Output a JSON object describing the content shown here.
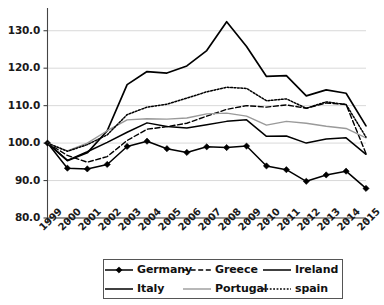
{
  "chart_data": {
    "type": "line",
    "title": "",
    "xlabel": "",
    "ylabel": "",
    "x": [
      "1999",
      "2000",
      "2001",
      "2002",
      "2003",
      "2004",
      "2005",
      "2006",
      "2007",
      "2008",
      "2009",
      "2010",
      "2011",
      "2012",
      "2013",
      "2014",
      "2015"
    ],
    "ylim": [
      80.0,
      135.0
    ],
    "yticks": [
      80.0,
      90.0,
      100.0,
      110.0,
      120.0,
      130.0
    ],
    "ytick_labels": [
      "80.0",
      "90.0",
      "100.0",
      "110.0",
      "120.0",
      "130.0"
    ],
    "grid": true,
    "legend_position": "bottom",
    "series": [
      {
        "name": "Germany",
        "style": "solid-marker",
        "marker": "diamond",
        "color": "#000000",
        "values": [
          100.0,
          93.3,
          93.1,
          94.3,
          99.1,
          100.5,
          98.5,
          97.5,
          99.0,
          98.8,
          99.2,
          93.9,
          92.9,
          89.8,
          91.5,
          92.5,
          87.9
        ]
      },
      {
        "name": "Greece",
        "style": "dashed",
        "marker": "none",
        "color": "#000000",
        "values": [
          100.0,
          96.7,
          94.9,
          96.4,
          100.7,
          103.7,
          104.4,
          105.3,
          107.2,
          109.0,
          110.0,
          109.6,
          110.2,
          109.3,
          110.7,
          110.3,
          97.2
        ]
      },
      {
        "name": "Ireland",
        "style": "solid-thick",
        "marker": "none",
        "color": "#000000",
        "values": [
          100.0,
          95.3,
          97.4,
          103.3,
          115.6,
          119.1,
          118.7,
          120.6,
          124.7,
          132.4,
          125.8,
          117.8,
          118.0,
          112.6,
          114.2,
          113.3,
          104.6
        ]
      },
      {
        "name": "Italy",
        "style": "solid",
        "marker": "none",
        "color": "#000000",
        "values": [
          100.0,
          95.4,
          97.7,
          100.2,
          102.9,
          105.4,
          104.4,
          104.0,
          104.9,
          105.8,
          106.2,
          101.8,
          101.9,
          100.0,
          101.1,
          101.4,
          97.0
        ]
      },
      {
        "name": "Portugal",
        "style": "solid-gray",
        "marker": "none",
        "color": "#9a9a9a",
        "values": [
          100.0,
          97.9,
          100.0,
          103.3,
          106.2,
          106.5,
          106.4,
          106.7,
          107.8,
          108.0,
          107.2,
          104.8,
          105.8,
          105.3,
          104.5,
          103.9,
          101.4
        ]
      },
      {
        "name": "spain",
        "style": "dotted",
        "marker": "none",
        "color": "#000000",
        "values": [
          100.0,
          97.8,
          99.6,
          102.2,
          107.6,
          109.6,
          110.4,
          112.0,
          113.7,
          114.9,
          114.6,
          111.3,
          111.8,
          109.3,
          111.0,
          110.3,
          101.6
        ]
      }
    ]
  },
  "legend": {
    "row1": [
      {
        "label": "Germany",
        "swatch": "line-diamond-swatch"
      },
      {
        "label": "Greece",
        "swatch": "line-dashed-swatch"
      },
      {
        "label": "Ireland",
        "swatch": "line-solid-swatch"
      }
    ],
    "row2": [
      {
        "label": "Italy",
        "swatch": "line-solid-swatch"
      },
      {
        "label": "Portugal",
        "swatch": "line-gray-swatch"
      },
      {
        "label": "spain",
        "swatch": "line-dotted-swatch"
      }
    ]
  }
}
